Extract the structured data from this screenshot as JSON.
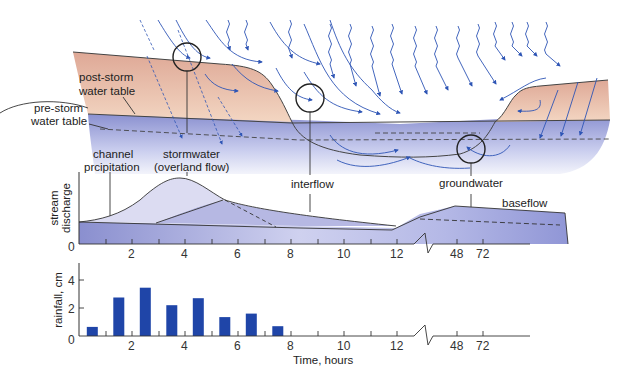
{
  "cross_section": {
    "labels": {
      "post_storm_line1": "post-storm",
      "post_storm_line2": "water table",
      "pre_storm_line1": "pre-storm",
      "pre_storm_line2": "water table",
      "channel_line1": "channel",
      "channel_line2": "prcipitation",
      "stormwater_line1": "stormwater",
      "stormwater_line2": "(overland flow)",
      "interflow": "interflow",
      "groundwater": "groundwater"
    },
    "colors": {
      "soil_top": "#e0ad9a",
      "soil_bottom": "#f2d2bc",
      "water_top": "#8f95d3",
      "water_bottom": "#eceef9",
      "arrow": "#2e55b5",
      "line": "#333333"
    }
  },
  "chart_data": [
    {
      "type": "area",
      "title": "",
      "ylabel_line1": "stream",
      "ylabel_line2": "discharge",
      "xlabel": "",
      "y_zero_label": "0",
      "x_ticks": [
        "2",
        "4",
        "6",
        "8",
        "10",
        "12",
        "48",
        "72"
      ],
      "x_break_between": [
        "12",
        "48"
      ],
      "series": [
        {
          "name": "channel precipitation",
          "description": "small rise at start of storm"
        },
        {
          "name": "stormwater (overland flow)",
          "peak_time_hours": 3.7,
          "description": "large bell-shaped peak"
        },
        {
          "name": "interflow",
          "peak_time_hours": 5.5,
          "description": "delayed secondary peak, slow recession to ~12 h"
        },
        {
          "name": "groundwater / baseflow",
          "description": "rises after 12 h, elevated at 48-72 h"
        }
      ],
      "annotations": [
        "baseflow"
      ]
    },
    {
      "type": "bar",
      "title": "",
      "ylabel": "rainfall, cm",
      "xlabel": "Time, hours",
      "y_ticks": [
        "0",
        "2",
        "4"
      ],
      "x_ticks": [
        "2",
        "4",
        "6",
        "8",
        "10",
        "12",
        "48",
        "72"
      ],
      "categories": [
        "0-1",
        "1-2",
        "2-3",
        "3-4",
        "4-5",
        "5-6",
        "6-7",
        "7-8"
      ],
      "values": [
        0.65,
        2.75,
        3.45,
        2.2,
        2.7,
        1.35,
        1.6,
        0.7
      ],
      "ylim": [
        0,
        5
      ],
      "bar_color": "#1f45a8"
    }
  ]
}
